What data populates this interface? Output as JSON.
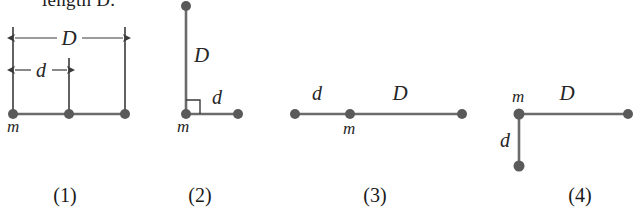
{
  "figure": {
    "clipped_header_text": "length D.",
    "colors": {
      "dot": "#5a5a5a",
      "rod": "#6b6b6b",
      "dimension_line": "#3a3a3a",
      "label": "#262626",
      "caption": "#1a1a1a",
      "background": "#ffffff"
    },
    "symbols": {
      "big_distance": "D",
      "small_distance": "d",
      "mass": "m"
    },
    "panels": [
      {
        "caption": "(1)",
        "type": "collinear-with-dimensions",
        "description": "Three equal masses on a straight horizontal rod; total span labeled D, left-to-middle span labeled d",
        "labels": {
          "span_total": "D",
          "span_partial": "d",
          "mass": "m"
        },
        "dots": [
          {
            "x": 13,
            "y": 114
          },
          {
            "x": 69,
            "y": 114
          },
          {
            "x": 125,
            "y": 114
          }
        ],
        "rod": {
          "x1": 13,
          "y1": 114,
          "x2": 125,
          "y2": 114
        },
        "dimensions": [
          {
            "label": "D",
            "x1": 13,
            "x2": 125,
            "y": 38,
            "label_x": 69,
            "label_y": 33
          },
          {
            "label": "d",
            "x1": 13,
            "x2": 69,
            "y": 70,
            "label_x": 41,
            "label_y": 65
          }
        ],
        "extension_lines": [
          {
            "x": 13,
            "y1": 27,
            "y2": 110
          },
          {
            "x": 69,
            "y1": 58,
            "y2": 110
          },
          {
            "x": 125,
            "y1": 27,
            "y2": 110
          }
        ],
        "mass_label": {
          "x": 7,
          "y": 132
        }
      },
      {
        "caption": "(2)",
        "type": "L-shape-up-right",
        "description": "Mass m at the corner; vertical rod of length D goes up, horizontal rod of length d goes right; right angle marked at corner",
        "labels": {
          "vertical": "D",
          "horizontal": "d",
          "mass": "m"
        },
        "corner": {
          "x": 186,
          "y": 114
        },
        "dots": [
          {
            "x": 186,
            "y": 6
          },
          {
            "x": 186,
            "y": 114
          },
          {
            "x": 238,
            "y": 114
          }
        ],
        "rods": [
          {
            "x1": 186,
            "y1": 6,
            "x2": 186,
            "y2": 114
          },
          {
            "x1": 186,
            "y1": 114,
            "x2": 238,
            "y2": 114
          }
        ],
        "right_angle_marker": {
          "x": 186,
          "y": 114,
          "size": 14
        },
        "label_positions": {
          "D": {
            "x": 194,
            "y": 62
          },
          "d": {
            "x": 212,
            "y": 104
          },
          "m": {
            "x": 177,
            "y": 132
          }
        }
      },
      {
        "caption": "(3)",
        "type": "collinear-labeled-segments",
        "description": "Three masses on a straight horizontal rod; mass m is the middle dot, left segment labeled d, right segment labeled D",
        "labels": {
          "left_segment": "d",
          "right_segment": "D",
          "mass": "m"
        },
        "dots": [
          {
            "x": 295,
            "y": 114
          },
          {
            "x": 350,
            "y": 114
          },
          {
            "x": 462,
            "y": 114
          }
        ],
        "rod": {
          "x1": 295,
          "y1": 114,
          "x2": 462,
          "y2": 114
        },
        "label_positions": {
          "d": {
            "x": 317,
            "y": 100
          },
          "D": {
            "x": 400,
            "y": 100
          },
          "m": {
            "x": 343,
            "y": 134
          }
        }
      },
      {
        "caption": "(4)",
        "type": "L-shape-right-down",
        "description": "Mass m at the top-left corner; horizontal rod of length D goes right, vertical rod of length d goes down",
        "labels": {
          "horizontal": "D",
          "vertical": "d",
          "mass": "m"
        },
        "corner": {
          "x": 519,
          "y": 114
        },
        "dots": [
          {
            "x": 519,
            "y": 114
          },
          {
            "x": 628,
            "y": 114
          },
          {
            "x": 519,
            "y": 166
          }
        ],
        "rods": [
          {
            "x1": 519,
            "y1": 114,
            "x2": 628,
            "y2": 114
          },
          {
            "x1": 519,
            "y1": 114,
            "x2": 519,
            "y2": 166
          }
        ],
        "label_positions": {
          "D": {
            "x": 567,
            "y": 100
          },
          "d": {
            "x": 505,
            "y": 147
          },
          "m": {
            "x": 512,
            "y": 102
          }
        }
      }
    ],
    "captions": [
      {
        "text": "(1)",
        "x": 65,
        "y": 202
      },
      {
        "text": "(2)",
        "x": 200,
        "y": 202
      },
      {
        "text": "(3)",
        "x": 375,
        "y": 202
      },
      {
        "text": "(4)",
        "x": 580,
        "y": 202
      }
    ]
  }
}
